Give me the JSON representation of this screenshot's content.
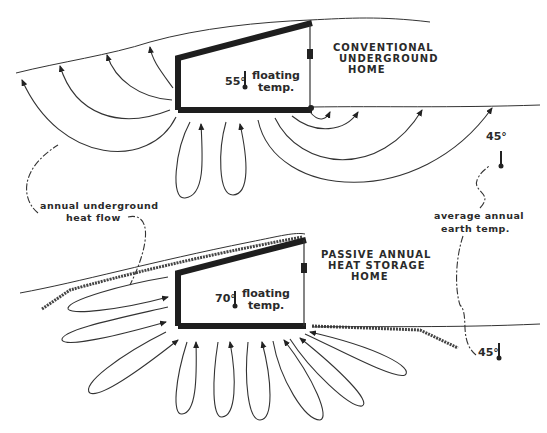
{
  "diagram": {
    "top": {
      "title_lines": [
        "CONVENTIONAL",
        "UNDERGROUND",
        "HOME"
      ],
      "inside_temp": "55°",
      "floating_label": [
        "floating",
        "temp."
      ],
      "earth_temp": "45°"
    },
    "bottom": {
      "title_lines": [
        "PASSIVE ANNUAL",
        "HEAT STORAGE",
        "HOME"
      ],
      "inside_temp": "70°",
      "floating_label": [
        "floating",
        "temp."
      ],
      "earth_temp": "45°"
    },
    "annotations": {
      "heat_flow": [
        "annual underground",
        "heat flow"
      ],
      "earth_temp": [
        "average annual",
        "earth temp."
      ]
    },
    "icons": [
      "thermometer-icon",
      "flow-arrow-icon"
    ],
    "colors": {
      "ink": "#1e1e1e",
      "paper": "#ffffff"
    }
  }
}
